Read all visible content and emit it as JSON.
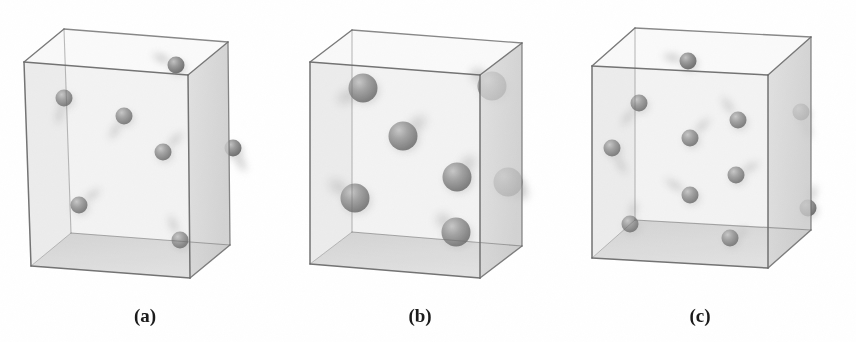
{
  "figure": {
    "type": "scientific-illustration",
    "background_color": "#ffffff",
    "panel_count": 3
  },
  "style": {
    "sphere_fill": "#8d8d8d",
    "sphere_shadow": "#6e6e6e",
    "sphere_highlight": "#bdbdbd",
    "box_edge_color": "#6d6d6d",
    "box_right_face": "#d8d8d8",
    "box_floor_face": "#d2d2d2",
    "box_back_face": "#f2f2f2",
    "box_left_face": "#e8e8e8",
    "trail_color": "#c4c4c4",
    "label_color": "#1b1b1b"
  },
  "panels": [
    {
      "id": "a",
      "label": "(a)",
      "label_x": 145,
      "label_y": 322,
      "sphere_count": 7,
      "sphere_radius": 8.5,
      "box": {
        "front_top_left": [
          24,
          62
        ],
        "front_top_right": [
          188,
          75
        ],
        "front_bottom_left": [
          31,
          266
        ],
        "front_bottom_right": [
          190,
          278
        ],
        "depth_dx": 40,
        "depth_dy": -33
      },
      "spheres": [
        {
          "cx": 176,
          "cy": 65,
          "r": 8.5,
          "trail_dx": -26,
          "trail_dy": -12
        },
        {
          "cx": 64,
          "cy": 98,
          "r": 8.5,
          "trail_dx": -8,
          "trail_dy": 30
        },
        {
          "cx": 124,
          "cy": 116,
          "r": 8.5,
          "trail_dx": -16,
          "trail_dy": 26
        },
        {
          "cx": 163,
          "cy": 152,
          "r": 8.5,
          "trail_dx": 22,
          "trail_dy": -22
        },
        {
          "cx": 233,
          "cy": 148,
          "r": 8.5,
          "trail_dx": 14,
          "trail_dy": 26
        },
        {
          "cx": 79,
          "cy": 205,
          "r": 8.5,
          "trail_dx": 24,
          "trail_dy": -18
        },
        {
          "cx": 180,
          "cy": 240,
          "r": 8.5,
          "trail_dx": -12,
          "trail_dy": -28
        }
      ]
    },
    {
      "id": "b",
      "label": "(b)",
      "label_x": 420,
      "label_y": 322,
      "sphere_count": 7,
      "sphere_radius": 14.5,
      "box": {
        "front_top_left": [
          310,
          62
        ],
        "front_top_right": [
          480,
          75
        ],
        "front_bottom_left": [
          310,
          264
        ],
        "front_bottom_right": [
          480,
          278
        ],
        "depth_dx": 42,
        "depth_dy": -32
      },
      "spheres": [
        {
          "cx": 363,
          "cy": 88,
          "r": 14.5,
          "trail_dx": -30,
          "trail_dy": 16
        },
        {
          "cx": 492,
          "cy": 86,
          "r": 14.5,
          "trail_dx": -24,
          "trail_dy": -18
        },
        {
          "cx": 403,
          "cy": 136,
          "r": 14.5,
          "trail_dx": 26,
          "trail_dy": -22
        },
        {
          "cx": 457,
          "cy": 177,
          "r": 14.5,
          "trail_dx": 20,
          "trail_dy": -24
        },
        {
          "cx": 355,
          "cy": 198,
          "r": 14.5,
          "trail_dx": -30,
          "trail_dy": -20
        },
        {
          "cx": 508,
          "cy": 182,
          "r": 14.5,
          "trail_dx": 22,
          "trail_dy": 18
        },
        {
          "cx": 456,
          "cy": 232,
          "r": 14.5,
          "trail_dx": -22,
          "trail_dy": -20
        }
      ]
    },
    {
      "id": "c",
      "label": "(c)",
      "label_x": 700,
      "label_y": 322,
      "sphere_count": 10,
      "sphere_radius": 8.5,
      "box": {
        "front_top_left": [
          592,
          66
        ],
        "front_top_right": [
          768,
          75
        ],
        "front_bottom_left": [
          592,
          258
        ],
        "front_bottom_right": [
          768,
          268
        ],
        "depth_dx": 43,
        "depth_dy": -38
      },
      "spheres": [
        {
          "cx": 688,
          "cy": 61,
          "r": 8.5,
          "trail_dx": -28,
          "trail_dy": -6
        },
        {
          "cx": 639,
          "cy": 103,
          "r": 8.5,
          "trail_dx": -20,
          "trail_dy": 26
        },
        {
          "cx": 612,
          "cy": 148,
          "r": 8.5,
          "trail_dx": 16,
          "trail_dy": 30
        },
        {
          "cx": 690,
          "cy": 138,
          "r": 8.5,
          "trail_dx": 22,
          "trail_dy": -22
        },
        {
          "cx": 738,
          "cy": 120,
          "r": 8.5,
          "trail_dx": -18,
          "trail_dy": -26
        },
        {
          "cx": 801,
          "cy": 112,
          "r": 8.5,
          "trail_dx": 10,
          "trail_dy": 30
        },
        {
          "cx": 736,
          "cy": 175,
          "r": 8.5,
          "trail_dx": 26,
          "trail_dy": -14
        },
        {
          "cx": 690,
          "cy": 195,
          "r": 8.5,
          "trail_dx": -28,
          "trail_dy": -18
        },
        {
          "cx": 630,
          "cy": 224,
          "r": 8.5,
          "trail_dx": 6,
          "trail_dy": -26
        },
        {
          "cx": 730,
          "cy": 238,
          "r": 8.5,
          "trail_dx": 22,
          "trail_dy": -10
        },
        {
          "cx": 808,
          "cy": 208,
          "r": 8.5,
          "trail_dx": 8,
          "trail_dy": -26
        }
      ]
    }
  ]
}
